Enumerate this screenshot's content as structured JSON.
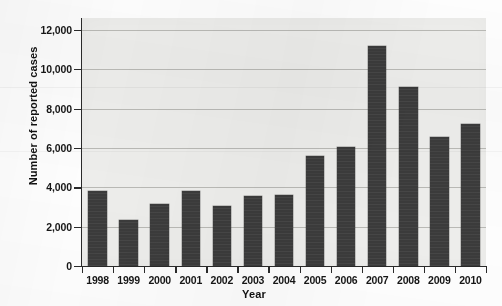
{
  "chart_data": {
    "type": "bar",
    "title": "",
    "subtitle": "",
    "xlabel": "Year",
    "ylabel": "Number of reported cases",
    "categories": [
      "1998",
      "1999",
      "2000",
      "2001",
      "2002",
      "2003",
      "2004",
      "2005",
      "2006",
      "2007",
      "2008",
      "2009",
      "2010"
    ],
    "values": [
      3800,
      2350,
      3150,
      3800,
      3050,
      3550,
      3600,
      5600,
      6050,
      11200,
      9100,
      6550,
      7200
    ],
    "series": [
      {
        "name": "Number of reported cases",
        "values": [
          3800,
          2350,
          3150,
          3800,
          3050,
          3550,
          3600,
          5600,
          6050,
          11200,
          9100,
          6550,
          7200
        ]
      }
    ],
    "ylim": [
      0,
      12600
    ],
    "xlim": [
      0,
      13
    ],
    "ytick_values": [
      0,
      2000,
      4000,
      6000,
      8000,
      10000,
      12000
    ],
    "ytick_labels": [
      "0",
      "2,000",
      "4,000",
      "6,000",
      "8,000",
      "10,000",
      "12,000"
    ],
    "xtick_labels": [
      "1998",
      "1999",
      "2000",
      "2001",
      "2002",
      "2003",
      "2004",
      "2005",
      "2006",
      "2007",
      "2008",
      "2009",
      "2010"
    ],
    "grid": true,
    "grid_axis": "y",
    "legend": false,
    "legend_position": "none",
    "bar_color": "#3b3b3b",
    "plot_background": "#ededeb",
    "gridline_color": "#b9b9b5",
    "axis_color": "#2a2a2a",
    "text_color": "#161616",
    "annotations": []
  }
}
